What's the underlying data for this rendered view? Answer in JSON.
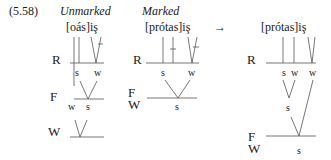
{
  "example": {
    "number": "(5.58)",
    "headers": {
      "unmarked": "Unmarked",
      "marked": "Marked"
    },
    "arrow": "→",
    "panels": [
      {
        "id": "unmarked",
        "word": "[oás]iş",
        "levels": [
          "R",
          "F",
          "W"
        ],
        "R_labels": [
          "s",
          "w"
        ],
        "F_labels": [
          "w",
          "s"
        ]
      },
      {
        "id": "marked",
        "word": "[prótas]iş",
        "levels": [
          "R",
          "F",
          "W"
        ],
        "R_labels": [
          "s",
          "w"
        ],
        "F_labels": [
          "s"
        ]
      },
      {
        "id": "result",
        "word": "[prótas]iş",
        "levels": [
          "R",
          "F",
          "W"
        ],
        "R_labels": [
          "s",
          "w",
          "w"
        ],
        "mid_labels": [
          "s"
        ],
        "F_labels": [
          "s"
        ]
      }
    ]
  }
}
